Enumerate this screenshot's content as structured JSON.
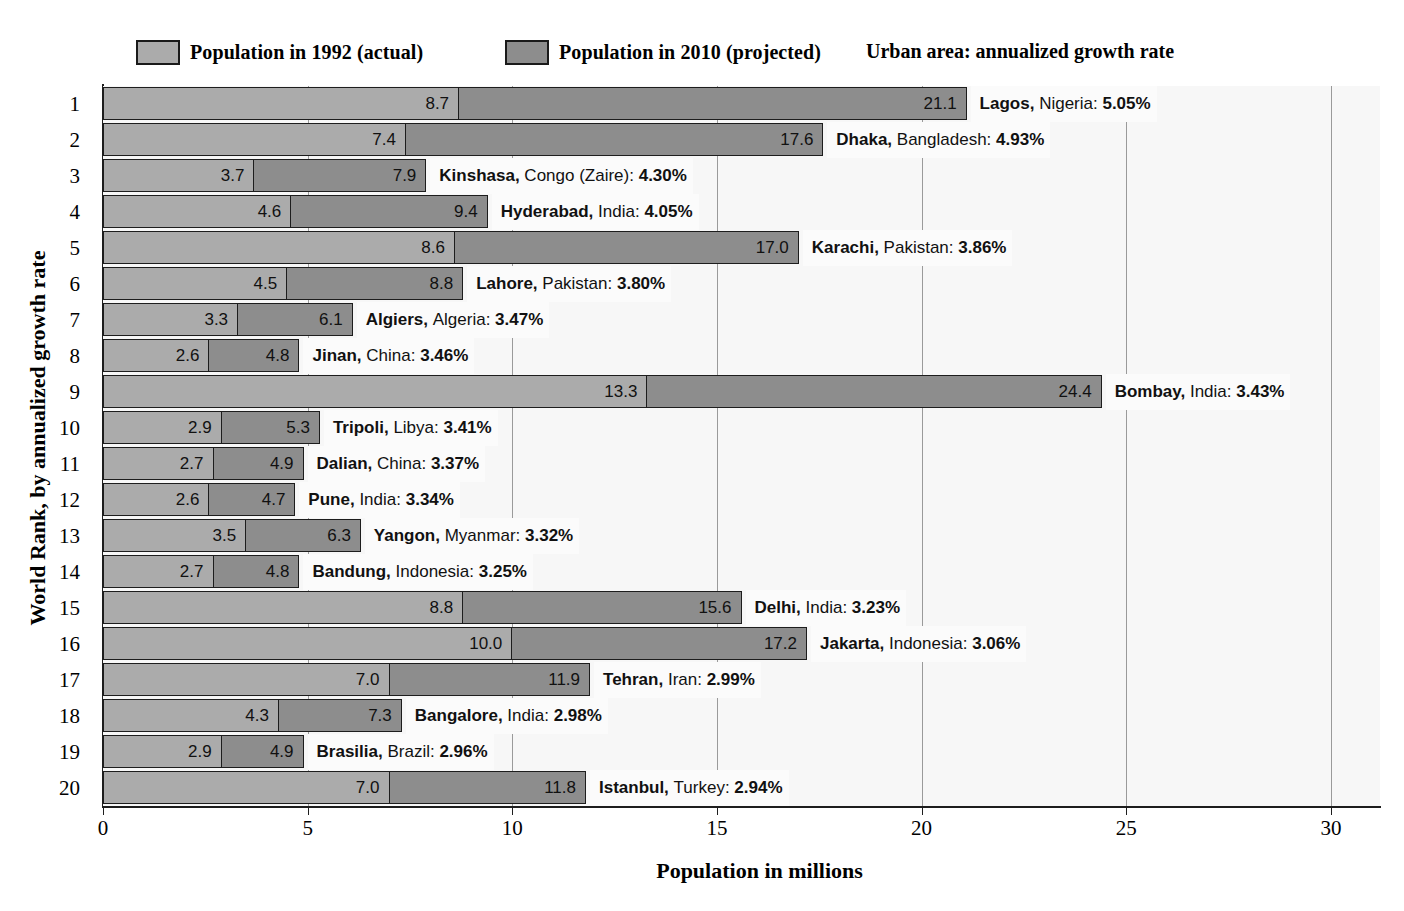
{
  "legend": {
    "series_1992_label": "Population in 1992 (actual)",
    "series_2010_label": "Population in 2010 (projected)",
    "note": "Urban area:  annualized growth rate",
    "color_1992": "#ababab",
    "color_2010": "#8d8d8d"
  },
  "axes": {
    "ylabel": "World Rank, by annualized growth rate",
    "xlabel": "Population in millions",
    "xticks": [
      "0",
      "5",
      "10",
      "15",
      "20",
      "25",
      "30"
    ],
    "xtick_values": [
      0,
      5,
      10,
      15,
      20,
      25,
      30
    ],
    "xlim": [
      0,
      31.2
    ],
    "yticks": [
      "1",
      "2",
      "3",
      "4",
      "5",
      "6",
      "7",
      "8",
      "9",
      "10",
      "11",
      "12",
      "13",
      "14",
      "15",
      "16",
      "17",
      "18",
      "19",
      "20"
    ]
  },
  "chart_data": {
    "type": "bar",
    "title": "",
    "subtitle": "",
    "xlabel": "Population in millions",
    "ylabel": "World Rank, by annualized growth rate",
    "xlim": [
      0,
      31.2
    ],
    "grid": true,
    "orientation": "horizontal",
    "legend_position": "top",
    "categories": [
      "Lagos",
      "Dhaka",
      "Kinshasa",
      "Hyderabad",
      "Karachi",
      "Lahore",
      "Algiers",
      "Jinan",
      "Bombay",
      "Tripoli",
      "Dalian",
      "Pune",
      "Yangon",
      "Bandung",
      "Delhi",
      "Jakarta",
      "Tehran",
      "Bangalore",
      "Brasilia",
      "Istanbul"
    ],
    "series": [
      {
        "name": "Population in 1992 (actual)",
        "values": [
          8.7,
          7.4,
          3.7,
          4.6,
          8.6,
          4.5,
          3.3,
          2.6,
          13.3,
          2.9,
          2.7,
          2.6,
          3.5,
          2.7,
          8.8,
          10.0,
          7.0,
          4.3,
          2.9,
          7.0
        ]
      },
      {
        "name": "Population in 2010 (projected)",
        "values": [
          21.1,
          17.6,
          7.9,
          9.4,
          17.0,
          8.8,
          6.1,
          4.8,
          24.4,
          5.3,
          4.9,
          4.7,
          6.3,
          4.8,
          15.6,
          17.2,
          11.9,
          7.3,
          4.9,
          11.8
        ]
      }
    ],
    "rows": [
      {
        "rank": "1",
        "city": "Lagos",
        "country": "Nigeria",
        "rate": "5.05%",
        "v1992": 8.7,
        "v2010": 21.1,
        "label_1992": "8.7",
        "label_2010": "21.1"
      },
      {
        "rank": "2",
        "city": "Dhaka",
        "country": "Bangladesh",
        "rate": "4.93%",
        "v1992": 7.4,
        "v2010": 17.6,
        "label_1992": "7.4",
        "label_2010": "17.6"
      },
      {
        "rank": "3",
        "city": "Kinshasa",
        "country": "Congo (Zaire)",
        "rate": "4.30%",
        "v1992": 3.7,
        "v2010": 7.9,
        "label_1992": "3.7",
        "label_2010": "7.9"
      },
      {
        "rank": "4",
        "city": "Hyderabad",
        "country": "India",
        "rate": "4.05%",
        "v1992": 4.6,
        "v2010": 9.4,
        "label_1992": "4.6",
        "label_2010": "9.4"
      },
      {
        "rank": "5",
        "city": "Karachi",
        "country": "Pakistan",
        "rate": "3.86%",
        "v1992": 8.6,
        "v2010": 17.0,
        "label_1992": "8.6",
        "label_2010": "17.0"
      },
      {
        "rank": "6",
        "city": "Lahore",
        "country": "Pakistan",
        "rate": "3.80%",
        "v1992": 4.5,
        "v2010": 8.8,
        "label_1992": "4.5",
        "label_2010": "8.8"
      },
      {
        "rank": "7",
        "city": "Algiers",
        "country": "Algeria",
        "rate": "3.47%",
        "v1992": 3.3,
        "v2010": 6.1,
        "label_1992": "3.3",
        "label_2010": "6.1"
      },
      {
        "rank": "8",
        "city": "Jinan",
        "country": "China",
        "rate": "3.46%",
        "v1992": 2.6,
        "v2010": 4.8,
        "label_1992": "2.6",
        "label_2010": "4.8"
      },
      {
        "rank": "9",
        "city": "Bombay",
        "country": "India",
        "rate": "3.43%",
        "v1992": 13.3,
        "v2010": 24.4,
        "label_1992": "13.3",
        "label_2010": "24.4"
      },
      {
        "rank": "10",
        "city": "Tripoli",
        "country": "Libya",
        "rate": "3.41%",
        "v1992": 2.9,
        "v2010": 5.3,
        "label_1992": "2.9",
        "label_2010": "5.3"
      },
      {
        "rank": "11",
        "city": "Dalian",
        "country": "China",
        "rate": "3.37%",
        "v1992": 2.7,
        "v2010": 4.9,
        "label_1992": "2.7",
        "label_2010": "4.9"
      },
      {
        "rank": "12",
        "city": "Pune",
        "country": "India",
        "rate": "3.34%",
        "v1992": 2.6,
        "v2010": 4.7,
        "label_1992": "2.6",
        "label_2010": "4.7"
      },
      {
        "rank": "13",
        "city": "Yangon",
        "country": "Myanmar",
        "rate": "3.32%",
        "v1992": 3.5,
        "v2010": 6.3,
        "label_1992": "3.5",
        "label_2010": "6.3"
      },
      {
        "rank": "14",
        "city": "Bandung",
        "country": "Indonesia",
        "rate": "3.25%",
        "v1992": 2.7,
        "v2010": 4.8,
        "label_1992": "2.7",
        "label_2010": "4.8"
      },
      {
        "rank": "15",
        "city": "Delhi",
        "country": "India",
        "rate": "3.23%",
        "v1992": 8.8,
        "v2010": 15.6,
        "label_1992": "8.8",
        "label_2010": "15.6"
      },
      {
        "rank": "16",
        "city": "Jakarta",
        "country": "Indonesia",
        "rate": "3.06%",
        "v1992": 10.0,
        "v2010": 17.2,
        "label_1992": "10.0",
        "label_2010": "17.2"
      },
      {
        "rank": "17",
        "city": "Tehran",
        "country": "Iran",
        "rate": "2.99%",
        "v1992": 7.0,
        "v2010": 11.9,
        "label_1992": "7.0",
        "label_2010": "11.9"
      },
      {
        "rank": "18",
        "city": "Bangalore",
        "country": "India",
        "rate": "2.98%",
        "v1992": 4.3,
        "v2010": 7.3,
        "label_1992": "4.3",
        "label_2010": "7.3"
      },
      {
        "rank": "19",
        "city": "Brasilia",
        "country": "Brazil",
        "rate": "2.96%",
        "v1992": 2.9,
        "v2010": 4.9,
        "label_1992": "2.9",
        "label_2010": "4.9"
      },
      {
        "rank": "20",
        "city": "Istanbul",
        "country": "Turkey",
        "rate": "2.94%",
        "v1992": 7.0,
        "v2010": 11.8,
        "label_1992": "7.0",
        "label_2010": "11.8"
      }
    ]
  }
}
